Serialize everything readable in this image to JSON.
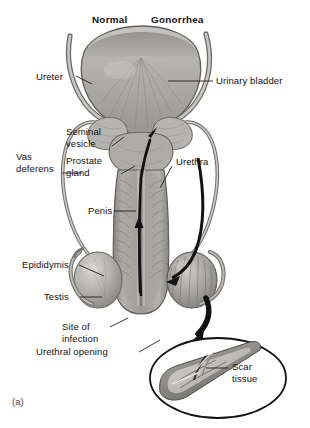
{
  "figure": {
    "panel_label": "(a)",
    "column_headers": [
      {
        "name": "normal",
        "text": "Normal"
      },
      {
        "name": "gonorrhea",
        "text": "Gonorrhea"
      }
    ],
    "labels": [
      {
        "id": "ureter",
        "text": "Ureter",
        "side": "left"
      },
      {
        "id": "urinary-bladder",
        "text": "Urinary bladder",
        "side": "right"
      },
      {
        "id": "seminal-vesicle",
        "text": "Seminal\nvesicle",
        "side": "left"
      },
      {
        "id": "vas-deferens",
        "text": "Vas\ndeferens",
        "side": "left"
      },
      {
        "id": "prostate-gland",
        "text": "Prostate\ngland",
        "side": "left"
      },
      {
        "id": "urethra",
        "text": "Urethra",
        "side": "right"
      },
      {
        "id": "penis",
        "text": "Penis",
        "side": "left"
      },
      {
        "id": "epididymis",
        "text": "Epididymis",
        "side": "left"
      },
      {
        "id": "testis",
        "text": "Testis",
        "side": "left"
      },
      {
        "id": "site-of-infection",
        "text": "Site of\ninfection",
        "side": "left"
      },
      {
        "id": "urethral-opening",
        "text": "Urethral opening",
        "side": "left"
      },
      {
        "id": "scar-tissue",
        "text": "Scar\ntissue",
        "side": "right"
      }
    ],
    "colors": {
      "tissue_light": "#cfcdc9",
      "tissue_mid": "#a9a7a3",
      "tissue_dark": "#7e7c79",
      "outline": "#5c5a57",
      "arrow": "#141414",
      "leader": "#1f1f1f",
      "background": "#ffffff"
    }
  }
}
